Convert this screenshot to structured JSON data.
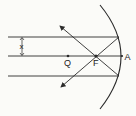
{
  "diagram": {
    "type": "concave-mirror-ray-diagram",
    "labels": {
      "focus": "F",
      "point_q": "Q",
      "pole": "A",
      "separation": "x"
    },
    "colors": {
      "line": "#2a2a2a",
      "background": "#fbfbf8"
    },
    "rays": [
      {
        "name": "upper-incident-ray",
        "description": "parallel ray at distance x above axis, reflects through F"
      },
      {
        "name": "principal-axis",
        "description": "axis through Q, F and A"
      },
      {
        "name": "lower-incident-ray",
        "description": "parallel ray at distance x below axis, reflects through F"
      }
    ]
  }
}
